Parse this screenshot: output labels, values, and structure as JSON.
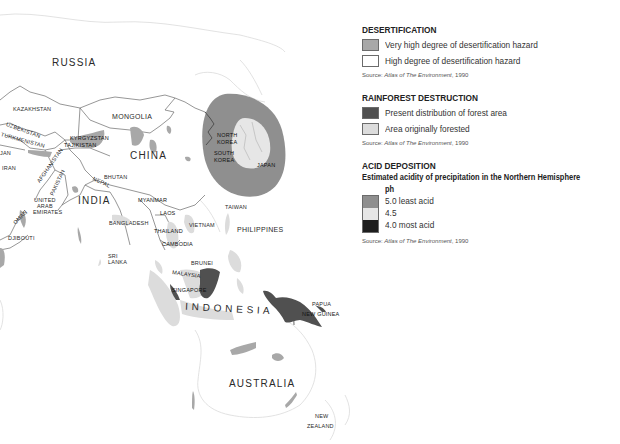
{
  "map": {
    "title": "Asia-Pacific environmental hazards map",
    "country_labels": {
      "russia": "RUSSIA",
      "kazakhstan": "KAZAKHSTAN",
      "mongolia": "MONGOLIA",
      "uzbekistan": "UZBEKISTAN",
      "turkmenistan": "TURKMENISTAN",
      "kyrgyzstan": "KYRGYZSTAN",
      "tajikistan": "TAJIKISTAN",
      "azerbaijan": "JAN",
      "iran": "IRAN",
      "afghanistan": "AFGHANISTAN",
      "pakistan": "PAKISTAN",
      "china": "CHINA",
      "north_korea_1": "NORTH",
      "north_korea_2": "KOREA",
      "south_korea_1": "SOUTH",
      "south_korea_2": "KOREA",
      "japan": "JAPAN",
      "bhutan": "BHUTAN",
      "nepal": "NEPAL",
      "india": "INDIA",
      "uae_1": "UNITED",
      "uae_2": "ARAB",
      "uae_3": "EMIRATES",
      "oman": "OMAN",
      "djibouti": "DJIBOUTI",
      "myanmar": "MYANMAR",
      "laos": "LAOS",
      "bangladesh": "BANGLADESH",
      "thailand": "THAILAND",
      "vietnam": "VIETNAM",
      "cambodia": "CAMBODIA",
      "taiwan": "TAIWAN",
      "philippines": "PHILIPPINES",
      "sri_lanka_1": "SRI",
      "sri_lanka_2": "LANKA",
      "brunei": "BRUNEI",
      "malaysia": "MALAYSIA",
      "singapore": "SINGAPORE",
      "indonesia": "I N D O N E S I A",
      "papua_1": "PAPUA",
      "papua_2": "NEW GUINEA",
      "australia": "AUSTRALIA",
      "nz_1": "NEW",
      "nz_2": "ZEALAND"
    },
    "colors": {
      "border": "#6a6a6a",
      "faint_coast": "#d6d6d6",
      "desert_very_high": "#a8a8a8",
      "desert_high": "#ffffff",
      "forest_present": "#505050",
      "forest_original": "#dcdcdc",
      "acid_5_0": "#8f8f8f",
      "acid_4_5": "#e6e6e6",
      "acid_4_0": "#1e1e1e"
    }
  },
  "legend": {
    "desertification": {
      "title": "DESERTIFICATION",
      "items": [
        {
          "label": "Very high degree of desertification hazard",
          "color": "#a8a8a8"
        },
        {
          "label": "High degree of desertification hazard",
          "color": "#ffffff"
        }
      ],
      "source_prefix": "Source: ",
      "source_title": "Atlas of The Environment",
      "source_year": ", 1990"
    },
    "rainforest": {
      "title": "RAINFOREST DESTRUCTION",
      "items": [
        {
          "label": "Present distribution of forest area",
          "color": "#505050"
        },
        {
          "label": "Area originally forested",
          "color": "#dcdcdc"
        }
      ],
      "source_prefix": "Source: ",
      "source_title": "Atlas of The Environment",
      "source_year": ", 1990"
    },
    "acid": {
      "title": "ACID DEPOSITION",
      "subtitle": "Estimated acidity of precipitation in the Northern Hemisphere",
      "unit": "ph",
      "items": [
        {
          "label": "5.0 least acid",
          "color": "#8f8f8f"
        },
        {
          "label": "4.5",
          "color": "#e6e6e6"
        },
        {
          "label": "4.0 most acid",
          "color": "#1e1e1e"
        }
      ],
      "source_prefix": "Source: ",
      "source_title": "Atlas of The Environment",
      "source_year": ", 1990"
    }
  }
}
